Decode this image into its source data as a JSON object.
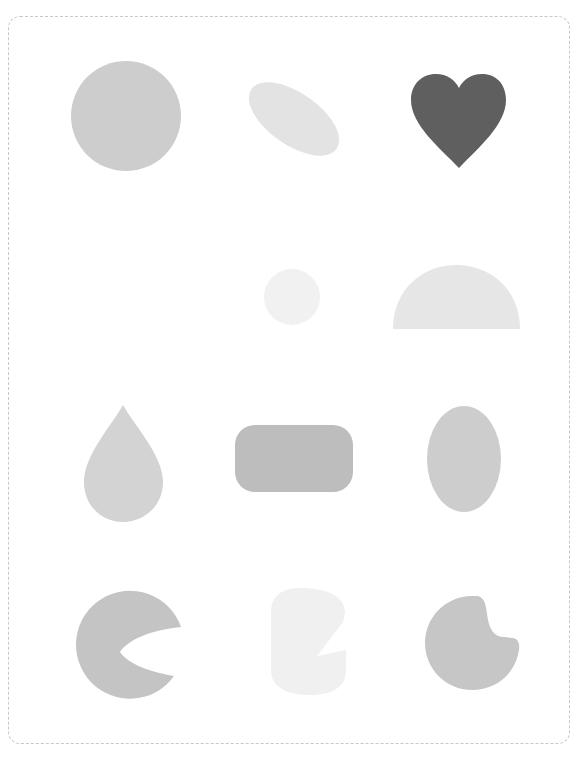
{
  "header": {
    "clipped_text": ""
  },
  "grid": {
    "rows": 4,
    "cols": 3,
    "cells": [
      {
        "row": 0,
        "col": 0,
        "shape": "circle",
        "color": "#cdcdcd"
      },
      {
        "row": 0,
        "col": 1,
        "shape": "rotated-ellipse",
        "color": "#e3e3e3"
      },
      {
        "row": 0,
        "col": 2,
        "shape": "heart",
        "color": "#5f5f5f"
      },
      {
        "row": 1,
        "col": 0,
        "shape": "empty",
        "color": ""
      },
      {
        "row": 1,
        "col": 1,
        "shape": "small-circle",
        "color": "#f1f1f1"
      },
      {
        "row": 1,
        "col": 2,
        "shape": "semicircle",
        "color": "#e6e6e6"
      },
      {
        "row": 2,
        "col": 0,
        "shape": "teardrop",
        "color": "#d3d3d3"
      },
      {
        "row": 2,
        "col": 1,
        "shape": "rounded-rectangle",
        "color": "#bdbdbd"
      },
      {
        "row": 2,
        "col": 2,
        "shape": "vertical-ellipse",
        "color": "#cdcdcd"
      },
      {
        "row": 3,
        "col": 0,
        "shape": "notched-circle-crescent",
        "color": "#c4c4c4"
      },
      {
        "row": 3,
        "col": 1,
        "shape": "notched-rounded-block",
        "color": "#f0f0f0"
      },
      {
        "row": 3,
        "col": 2,
        "shape": "bitten-circle",
        "color": "#c6c6c6"
      }
    ]
  }
}
